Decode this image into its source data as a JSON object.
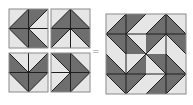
{
  "diagram": {
    "colors": {
      "dark": "#6e6e6e",
      "light": "#e6e6e6",
      "line": "#1e1e1e",
      "background": "#ffffff"
    },
    "operator": "=",
    "blocks": [
      {
        "name": "block-arrow-left",
        "x": 9,
        "y": 9,
        "cells": [
          "/-dr",
          "/-ul",
          "\\-ur",
          "\\-dl"
        ]
      },
      {
        "name": "block-arrow-up",
        "x": 51,
        "y": 9,
        "cells": [
          "/-dr",
          "\\-dl",
          "/-ul",
          "\\-ur"
        ]
      },
      {
        "name": "block-chevron-down",
        "x": 9,
        "y": 53,
        "cells": [
          "\\-dl",
          "/-dr",
          "\\-ur",
          "/-ul"
        ]
      },
      {
        "name": "block-arrow-right",
        "x": 51,
        "y": 53,
        "cells": [
          "\\-ur",
          "\\-dl",
          "/-dr",
          "/-ul"
        ]
      }
    ],
    "block_size": 39,
    "composite": {
      "x": 106,
      "y": 14,
      "size": 80,
      "layout": [
        [
          "block-arrow-left",
          "block-arrow-up"
        ],
        [
          "block-chevron-down",
          "block-arrow-right"
        ]
      ]
    }
  }
}
